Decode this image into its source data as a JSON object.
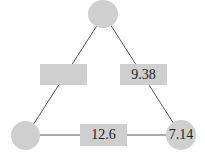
{
  "diagram": {
    "type": "triangle",
    "colors": {
      "fill": "#cfcfcf",
      "line": "#555555"
    },
    "nodes": [
      {
        "id": "top",
        "label": ""
      },
      {
        "id": "bottom-left",
        "label": ""
      },
      {
        "id": "bottom-right",
        "label": "7.14"
      }
    ],
    "edges": [
      {
        "from": "top",
        "to": "bottom-left",
        "label": ""
      },
      {
        "from": "top",
        "to": "bottom-right",
        "label": "9.38"
      },
      {
        "from": "bottom-left",
        "to": "bottom-right",
        "label": "12.6"
      }
    ]
  }
}
